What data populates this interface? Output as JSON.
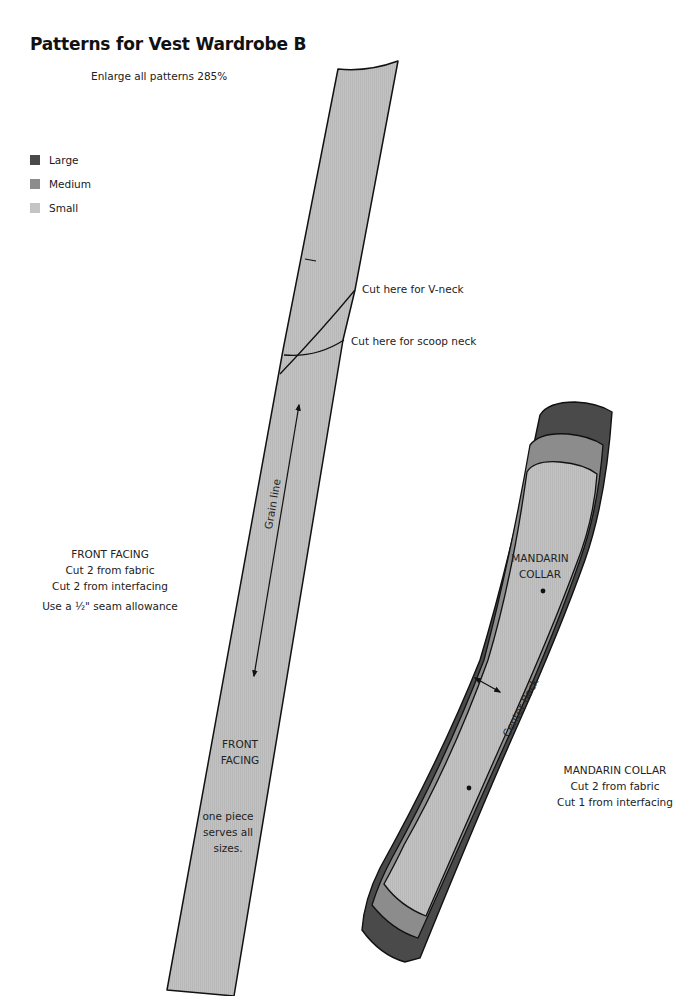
{
  "header": {
    "title": "Patterns for Vest Wardrobe B",
    "subtitle": "Enlarge all patterns 285%"
  },
  "legend": {
    "items": [
      {
        "label": "Large",
        "color": "#4a4a4a"
      },
      {
        "label": "Medium",
        "color": "#8c8c8c"
      },
      {
        "label": "Small",
        "color": "#c4c4c4"
      }
    ]
  },
  "colors": {
    "outline": "#111111",
    "piece_fill": "#c0c0c0",
    "large": "#4a4a4a",
    "medium": "#8c8c8c",
    "small": "#c0c0c0"
  },
  "front_facing": {
    "annotations": {
      "v_neck": "Cut here for V-neck",
      "scoop_neck": "Cut here for scoop neck",
      "grain_line": "Grain line"
    },
    "piece_label": [
      "FRONT",
      "FACING"
    ],
    "piece_note": [
      "one piece",
      "serves all",
      "sizes."
    ],
    "instructions": {
      "name": "FRONT FACING",
      "line1": "Cut 2 from fabric",
      "line2": "Cut 2 from interfacing",
      "seam_prefix": "Use a ",
      "seam_fraction": "½",
      "seam_suffix": "\" seam allowance"
    }
  },
  "mandarin_collar": {
    "piece_label": [
      "MANDARIN",
      "COLLAR"
    ],
    "center_back": "Center Back",
    "instructions": {
      "name": "MANDARIN COLLAR",
      "line1": "Cut 2 from fabric",
      "line2": "Cut 1 from interfacing"
    }
  }
}
